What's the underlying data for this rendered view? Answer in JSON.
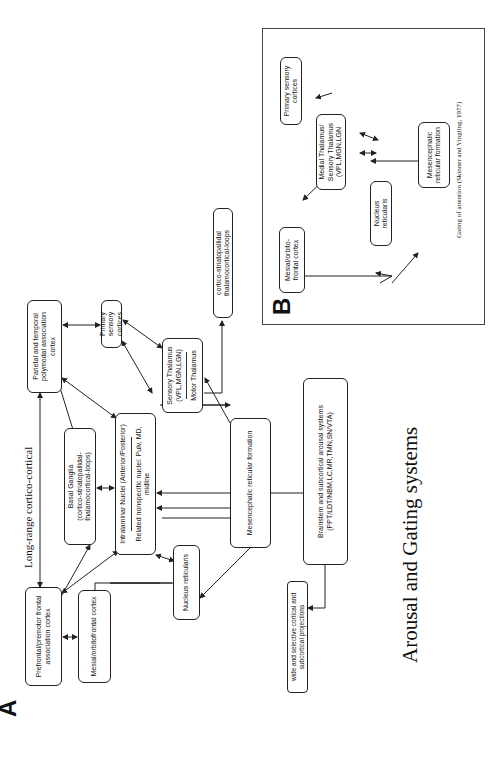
{
  "title": "Arousal and Gating systems",
  "panel_a": {
    "letter": "A",
    "long_range_label": "Long-range cortico-cortical",
    "boxes": {
      "prefrontal": "Prefrontal/premotor frontal association cortex",
      "mesial_orbitofrontal": "Mesial/orbitofrontal cortex",
      "basal_ganglia": {
        "line1": "Basal Ganglia",
        "line2": "(cortico-striatopallidal-thalamocortical-loops)"
      },
      "intralaminar": {
        "top": "Intralaminar Nuclei (Anterior/Posterior)",
        "bottom": "Related nonspecific nuclei: Pulv, MD, midline"
      },
      "nucleus_reticularis": "Nucleus reticularis",
      "parietal_temporal": "Parietal and temporal polymodal association cortex",
      "primary_sensory": "Primary sensory cortices",
      "sensory_thalamus": {
        "top": "Sensory Thalamus (VPL,MGN,LGN)",
        "bottom": "Motor Thalamus"
      },
      "cortico_striatopallidal": "cortico-striatopallidal thalamocortical-loops",
      "mesencephalic_rf": "Mesencephalic reticular formation",
      "brainstem": {
        "line1": "Brainstem and subcortical arousal systems",
        "line2": "(PPT/LDT/NBM,LC,MR,TMN,SN/VTA)"
      },
      "projections": "wide and selective cortical and subcortical projections"
    }
  },
  "panel_b": {
    "letter": "B",
    "boxes": {
      "primary_sensory": "Primary sensory cortices",
      "medial_thalamus": "Medial Thalamus/ Sensory Thalamus (VPL,MGN,LGN",
      "mesial_orbitofrontal": "Mesial/orbito-frontal cortex",
      "nucleus_reticularis": "Nucleus reticularis",
      "mesencephalic_rf": "Mesencephalic reticular formation"
    },
    "caption": "Gating of attention (Skinner and Yingling, 1977)"
  }
}
